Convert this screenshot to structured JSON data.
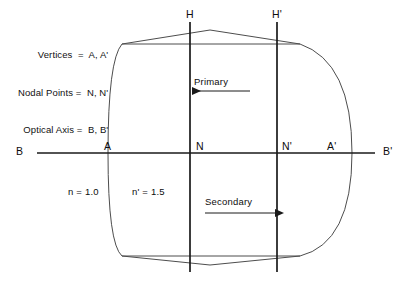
{
  "diagram": {
    "legend": {
      "lines": [
        "Vertices  =  A, A'",
        "Nodal Points =  N, N'",
        "Optical Axis =  B, B'"
      ]
    },
    "labels": {
      "principal_plane_h": "H",
      "principal_plane_h_prime": "H'",
      "axis_left": "B",
      "axis_right": "B'",
      "vertex_left": "A",
      "vertex_right": "A'",
      "nodal_left": "N",
      "nodal_right": "N'",
      "index_object": "n = 1.0",
      "index_lens": "n' = 1.5",
      "arrow_primary": "Primary",
      "arrow_secondary": "Secondary"
    },
    "colors": {
      "background": "#ffffff",
      "stroke": "#1a1a1a",
      "lens_outline": "#4d4d4d",
      "text": "#0d0d0d"
    },
    "geometry": {
      "optical_axis_y": 153,
      "axis_x_start": 37,
      "axis_x_end": 375,
      "vertex_left_x": 122,
      "vertex_right_x": 340,
      "plane_h_x": 190,
      "plane_h_prime_x": 277,
      "plane_y_top": 22,
      "plane_y_bottom": 272,
      "lens_top_y": 30,
      "lens_bottom_y": 265
    }
  }
}
